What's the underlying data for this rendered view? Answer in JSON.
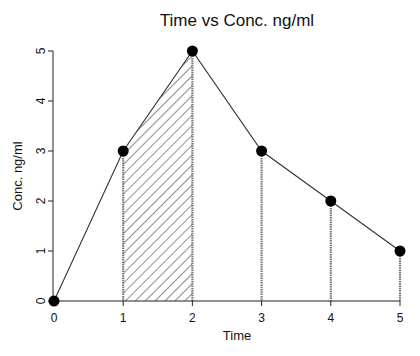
{
  "chart_data": {
    "type": "line",
    "title": "Time vs Conc.   ng/ml",
    "xlabel": "Time",
    "ylabel": "Conc.   ng/ml",
    "x": [
      0,
      1,
      2,
      3,
      4,
      5
    ],
    "series": [
      {
        "name": "Concentration",
        "values": [
          0,
          3,
          5,
          3,
          2,
          1
        ]
      }
    ],
    "xticks": [
      "0",
      "1",
      "2",
      "3",
      "4",
      "5"
    ],
    "yticks": [
      "0",
      "1",
      "2",
      "3",
      "4",
      "5"
    ],
    "xlim": [
      0,
      5
    ],
    "ylim": [
      0,
      5
    ],
    "grid": false,
    "annotations": {
      "hatched_area": {
        "from_x": 1,
        "to_x": 2,
        "description": "Area under curve between t=1 and t=2 (trapezoid)"
      },
      "drop_lines_at_x": [
        1,
        2,
        3,
        4,
        5
      ]
    }
  }
}
